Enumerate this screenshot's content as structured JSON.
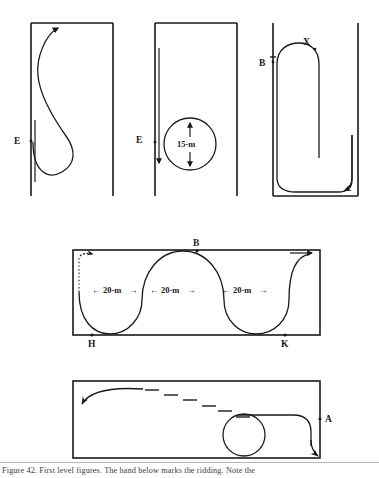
{
  "figure": {
    "caption": "Figure 42.  First level figures.  The hand below marks the ridding.  Note the",
    "ink_color": "#1a1a1a",
    "background_color": "#ffffff"
  },
  "panels": [
    {
      "id": "panel-1",
      "name": "teardrop-loop-panel",
      "labels": [
        {
          "text": "E",
          "x": 14,
          "y": 141,
          "marker": true
        }
      ],
      "notes": "Rectangle open at left; teardrop / S-shaped loop from E with arrow at top"
    },
    {
      "id": "panel-2",
      "name": "circle-15m-panel",
      "labels": [
        {
          "text": "E",
          "x": 136,
          "y": 140,
          "marker": true
        },
        {
          "text": "15-m",
          "x": 190,
          "y": 143,
          "marker": false
        }
      ],
      "dimension": "15-m",
      "notes": "Rectangle open at left; circle with up and down arrows labelled 15-m; down arrow at E"
    },
    {
      "id": "panel-3",
      "name": "hairpin-panel",
      "labels": [
        {
          "text": "B",
          "x": 264,
          "y": 63,
          "marker": true
        },
        {
          "text": "X",
          "x": 308,
          "y": 44,
          "marker": true
        }
      ],
      "notes": "Two vertical walls and a floor; long hairpin loop from B up to X and around to arrow at lower right"
    },
    {
      "id": "panel-4",
      "name": "serpentine-panel",
      "labels": [
        {
          "text": "B",
          "x": 201,
          "y": 245,
          "marker": true
        },
        {
          "text": "H",
          "x": 88,
          "y": 345,
          "marker": true
        },
        {
          "text": "K",
          "x": 281,
          "y": 345,
          "marker": true
        }
      ],
      "dimensions": [
        {
          "text": "20-m",
          "x": 116,
          "y": 290
        },
        {
          "text": "20-m",
          "x": 193,
          "y": 290
        },
        {
          "text": "20-m",
          "x": 270,
          "y": 290
        }
      ],
      "notes": "Wide rectangle containing a serpentine (slalom) curve touching B at top centre and H, K on the bottom line; three 20-m spans with left/right arrows"
    },
    {
      "id": "panel-5",
      "name": "circle-and-dashed-diagonal-panel",
      "labels": [
        {
          "text": "A",
          "x": 320,
          "y": 423,
          "marker": true
        }
      ],
      "notes": "Wide rectangle; curve from A looping around a circle, dashed diagonal rising to the left ending in a curved arrow"
    }
  ],
  "dimension_arrows": {
    "left_glyph": "←",
    "right_glyph": "→",
    "up_glyph": "↑",
    "down_glyph": "↓"
  }
}
